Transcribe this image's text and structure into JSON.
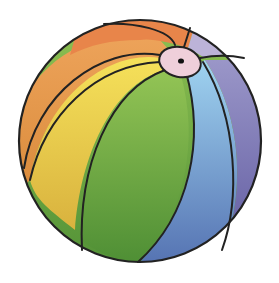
{
  "image": {
    "subject": "beach ball",
    "description": "Colored-pencil style illustration of a multicolored beach ball with a pink valve at the top",
    "colors": {
      "orange_dark": "#e98a45",
      "orange_light": "#efa04f",
      "yellow": "#f1d24d",
      "green": "#7fb94b",
      "green_dark": "#5e9b3a",
      "light_blue": "#8ec8ec",
      "blue": "#6b91c9",
      "lavender": "#b8b0d6",
      "purple": "#7d79b4",
      "valve_pink": "#efcfda",
      "outline": "#222222"
    }
  }
}
